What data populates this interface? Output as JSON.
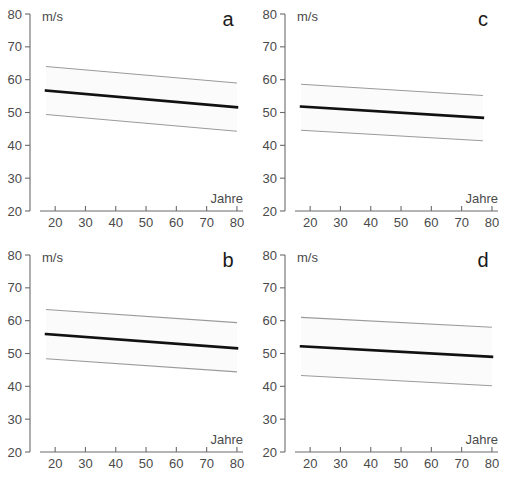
{
  "figure": {
    "unit_label": "m/s",
    "x_axis_label": "Jahre",
    "y_ticks": [
      20,
      30,
      40,
      50,
      60,
      70,
      80
    ],
    "x_ticks": [
      20,
      30,
      40,
      50,
      60,
      70,
      80
    ]
  },
  "chart_data": [
    {
      "type": "line",
      "panel": "a",
      "title": "a",
      "xlabel": "Jahre",
      "ylabel": "m/s",
      "xlim": [
        15,
        82
      ],
      "ylim": [
        20,
        80
      ],
      "grid": false,
      "legend": "none",
      "x": [
        17,
        80
      ],
      "series": [
        {
          "name": "upper confidence limit",
          "values": [
            64.0,
            59.0
          ]
        },
        {
          "name": "regression line",
          "values": [
            56.7,
            51.6
          ]
        },
        {
          "name": "lower confidence limit",
          "values": [
            49.4,
            44.3
          ]
        }
      ]
    },
    {
      "type": "line",
      "panel": "c",
      "title": "c",
      "xlabel": "Jahre",
      "ylabel": "m/s",
      "xlim": [
        15,
        82
      ],
      "ylim": [
        20,
        80
      ],
      "grid": false,
      "legend": "none",
      "x": [
        17,
        77
      ],
      "series": [
        {
          "name": "upper confidence limit",
          "values": [
            58.6,
            55.2
          ]
        },
        {
          "name": "regression line",
          "values": [
            51.8,
            48.4
          ]
        },
        {
          "name": "lower confidence limit",
          "values": [
            44.6,
            41.4
          ]
        }
      ]
    },
    {
      "type": "line",
      "panel": "b",
      "title": "b",
      "xlabel": "Jahre",
      "ylabel": "m/s",
      "xlim": [
        15,
        82
      ],
      "ylim": [
        20,
        80
      ],
      "grid": false,
      "legend": "none",
      "x": [
        17,
        80
      ],
      "series": [
        {
          "name": "upper confidence limit",
          "values": [
            63.4,
            59.4
          ]
        },
        {
          "name": "regression line",
          "values": [
            55.9,
            51.6
          ]
        },
        {
          "name": "lower confidence limit",
          "values": [
            48.4,
            44.4
          ]
        }
      ]
    },
    {
      "type": "line",
      "panel": "d",
      "title": "d",
      "xlabel": "Jahre",
      "ylabel": "m/s",
      "xlim": [
        15,
        82
      ],
      "ylim": [
        20,
        80
      ],
      "grid": false,
      "legend": "none",
      "x": [
        17,
        80
      ],
      "series": [
        {
          "name": "upper confidence limit",
          "values": [
            61.0,
            58.0
          ]
        },
        {
          "name": "regression line",
          "values": [
            52.2,
            49.0
          ]
        },
        {
          "name": "lower confidence limit",
          "values": [
            43.3,
            40.2
          ]
        }
      ]
    }
  ],
  "colors": {
    "fit_line": "#111111",
    "band_edge": "#9a9a9a",
    "band_fill": "#fbfbfb",
    "axis": "#6b6b6b",
    "text": "#4a4a4a",
    "background": "#ffffff"
  }
}
